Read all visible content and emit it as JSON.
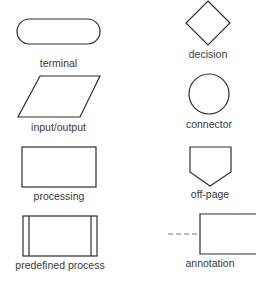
{
  "diagram": {
    "symbols": [
      {
        "id": "terminal",
        "label": "terminal",
        "shape": "rounded-rectangle"
      },
      {
        "id": "decision",
        "label": "decision",
        "shape": "diamond"
      },
      {
        "id": "input-output",
        "label": "input/output",
        "shape": "parallelogram"
      },
      {
        "id": "connector",
        "label": "connector",
        "shape": "circle"
      },
      {
        "id": "processing",
        "label": "processing",
        "shape": "rectangle"
      },
      {
        "id": "off-page",
        "label": "off-page",
        "shape": "pentagon-down"
      },
      {
        "id": "predefined-process",
        "label": "predefined process",
        "shape": "rectangle-with-side-bars"
      },
      {
        "id": "annotation",
        "label": "annotation",
        "shape": "open-bracket-with-dashed-line"
      }
    ],
    "colors": {
      "stroke": "#2e2e2e",
      "text": "#3a3a3a",
      "dash": "#777777",
      "background": "#ffffff"
    }
  }
}
